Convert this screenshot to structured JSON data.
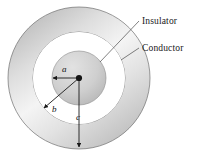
{
  "figure": {
    "type": "physics-diagram",
    "background_color": "#ffffff",
    "callouts": [
      {
        "id": "insulator",
        "label": "Insulator"
      },
      {
        "id": "conductor",
        "label": "Conductor"
      }
    ],
    "radii": [
      {
        "id": "a",
        "label": "a",
        "description": "inner-conductor-radius"
      },
      {
        "id": "b",
        "label": "b",
        "description": "insulator-outer-radius"
      },
      {
        "id": "c",
        "label": "c",
        "description": "outer-conductor-radius"
      }
    ],
    "geometry": {
      "center_x": 79,
      "center_y": 78,
      "radius_a": 27,
      "radius_b": 46,
      "radius_c": 71
    },
    "colors": {
      "shade_light": "#f2f2f2",
      "shade_mid": "#c9c9c9",
      "shade_dark": "#9c9c9c",
      "insulator_fill": "#ffffff",
      "stroke": "#4a4a4a",
      "text": "#17171a"
    }
  }
}
